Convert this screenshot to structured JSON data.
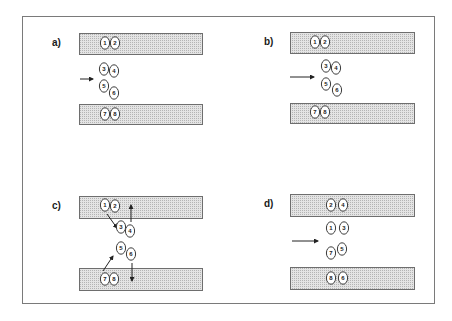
{
  "diagram": {
    "frame": {
      "x": 22,
      "y": 16,
      "w": 412,
      "h": 287
    },
    "bar_fill": "#dcdcdc",
    "panels": [
      {
        "label": "a)",
        "label_pos": [
          52,
          46
        ],
        "bars": [
          {
            "x": 79,
            "y": 33,
            "w": 123,
            "h": 21
          },
          {
            "x": 79,
            "y": 104,
            "w": 123,
            "h": 20
          }
        ],
        "ions": [
          {
            "n": "1",
            "x": 105,
            "y": 43
          },
          {
            "n": "2",
            "x": 115,
            "y": 43
          },
          {
            "n": "3",
            "x": 104,
            "y": 69
          },
          {
            "n": "4",
            "x": 114,
            "y": 71
          },
          {
            "n": "5",
            "x": 104,
            "y": 86
          },
          {
            "n": "6",
            "x": 114,
            "y": 93
          },
          {
            "n": "7",
            "x": 105,
            "y": 114
          },
          {
            "n": "8",
            "x": 115,
            "y": 114
          }
        ],
        "arrows": [
          {
            "x1": 80,
            "y1": 79,
            "x2": 93,
            "y2": 79
          }
        ]
      },
      {
        "label": "b)",
        "label_pos": [
          264,
          45
        ],
        "bars": [
          {
            "x": 290,
            "y": 32,
            "w": 124,
            "h": 21
          },
          {
            "x": 290,
            "y": 103,
            "w": 124,
            "h": 20
          }
        ],
        "ions": [
          {
            "n": "1",
            "x": 315,
            "y": 42
          },
          {
            "n": "2",
            "x": 325,
            "y": 42
          },
          {
            "n": "3",
            "x": 326,
            "y": 66
          },
          {
            "n": "4",
            "x": 336,
            "y": 68
          },
          {
            "n": "5",
            "x": 326,
            "y": 84
          },
          {
            "n": "6",
            "x": 337,
            "y": 90
          },
          {
            "n": "7",
            "x": 315,
            "y": 112
          },
          {
            "n": "8",
            "x": 325,
            "y": 112
          }
        ],
        "arrows": [
          {
            "x1": 290,
            "y1": 77,
            "x2": 314,
            "y2": 77
          }
        ]
      },
      {
        "label": "c)",
        "label_pos": [
          52,
          209
        ],
        "bars": [
          {
            "x": 79,
            "y": 196,
            "w": 123,
            "h": 22
          },
          {
            "x": 79,
            "y": 268,
            "w": 123,
            "h": 22
          }
        ],
        "ions": [
          {
            "n": "1",
            "x": 105,
            "y": 205
          },
          {
            "n": "2",
            "x": 115,
            "y": 206
          },
          {
            "n": "3",
            "x": 121,
            "y": 227
          },
          {
            "n": "4",
            "x": 130,
            "y": 231
          },
          {
            "n": "5",
            "x": 121,
            "y": 248
          },
          {
            "n": "6",
            "x": 131,
            "y": 254
          },
          {
            "n": "7",
            "x": 105,
            "y": 279
          },
          {
            "n": "8",
            "x": 114,
            "y": 279
          }
        ],
        "arrows": [
          {
            "x1": 107,
            "y1": 214,
            "x2": 117,
            "y2": 228
          },
          {
            "x1": 131,
            "y1": 222,
            "x2": 131,
            "y2": 205
          },
          {
            "x1": 103,
            "y1": 271,
            "x2": 113,
            "y2": 256
          },
          {
            "x1": 132,
            "y1": 263,
            "x2": 132,
            "y2": 281
          }
        ]
      },
      {
        "label": "d)",
        "label_pos": [
          264,
          207
        ],
        "bars": [
          {
            "x": 290,
            "y": 194,
            "w": 124,
            "h": 22
          },
          {
            "x": 290,
            "y": 267,
            "w": 124,
            "h": 22
          }
        ],
        "ions": [
          {
            "n": "2",
            "x": 331,
            "y": 205
          },
          {
            "n": "4",
            "x": 343,
            "y": 205
          },
          {
            "n": "1",
            "x": 331,
            "y": 228
          },
          {
            "n": "3",
            "x": 344,
            "y": 228
          },
          {
            "n": "7",
            "x": 331,
            "y": 253
          },
          {
            "n": "5",
            "x": 342,
            "y": 249
          },
          {
            "n": "8",
            "x": 331,
            "y": 278
          },
          {
            "n": "6",
            "x": 343,
            "y": 278
          }
        ],
        "arrows": [
          {
            "x1": 292,
            "y1": 241,
            "x2": 318,
            "y2": 241
          }
        ]
      }
    ]
  }
}
